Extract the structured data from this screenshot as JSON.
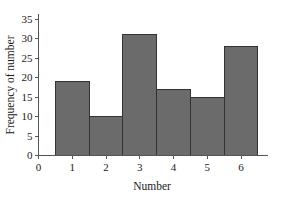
{
  "chart_data": {
    "type": "bar",
    "title": "",
    "subtitle": "",
    "xlabel": "Number",
    "ylabel": "Frequency of number",
    "categories": [
      "1",
      "2",
      "3",
      "4",
      "5",
      "6"
    ],
    "values": [
      19,
      10,
      31,
      17,
      15,
      28
    ],
    "series": [
      {
        "name": "Frequency of number",
        "values": [
          19,
          10,
          31,
          17,
          15,
          28
        ]
      }
    ],
    "xlim": [
      0,
      6.8
    ],
    "ylim": [
      0,
      35
    ],
    "x_tick_labels": [
      "0",
      "1",
      "2",
      "3",
      "4",
      "5",
      "6"
    ],
    "x_tick_values": [
      0,
      1,
      2,
      3,
      4,
      5,
      6
    ],
    "y_tick_labels": [
      "0",
      "5",
      "10",
      "15",
      "20",
      "25",
      "30",
      "35"
    ],
    "y_tick_values": [
      0,
      5,
      10,
      15,
      20,
      25,
      30,
      35
    ],
    "grid": false,
    "legend": false,
    "legend_position": "none",
    "bar_style": "contiguous-histogram",
    "bar_fill_color": "#6b6b6b",
    "bar_edge_color": "#333333",
    "axis_color": "#555555",
    "background_color": "#ffffff",
    "annotations": []
  }
}
